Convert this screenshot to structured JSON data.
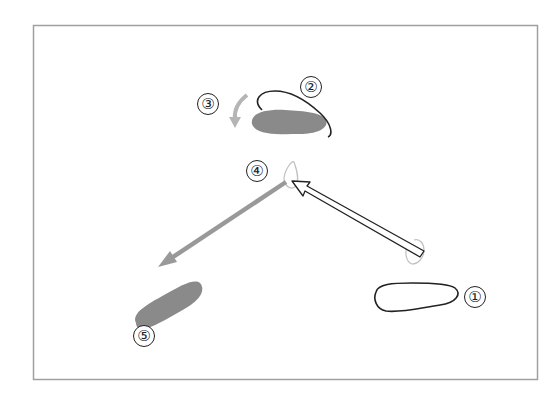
{
  "diagram": {
    "type": "motion-sequence",
    "frame": {
      "x": 33,
      "y": 25,
      "width": 505,
      "height": 355,
      "stroke": "#a0a0a0"
    },
    "colors": {
      "outline": "#222222",
      "fill_shape": "#8a8a8a",
      "gray_arrow": "#999999",
      "light_arrow": "#b5b5b5",
      "white_arrow_fill": "#ffffff"
    },
    "steps": [
      {
        "id": "1",
        "label": "①",
        "description": "outlined blob (start position)",
        "x": 475,
        "y": 297
      },
      {
        "id": "2",
        "label": "②",
        "description": "outlined blob tilted above gray blob",
        "x": 311,
        "y": 87
      },
      {
        "id": "3",
        "label": "③",
        "description": "curved light-gray arrow pointing down-left",
        "x": 208,
        "y": 104
      },
      {
        "id": "4",
        "label": "④",
        "description": "pivot point where white arrow meets gray arrow",
        "x": 257,
        "y": 171
      },
      {
        "id": "5",
        "label": "⑤",
        "description": "gray filled blob (end position)",
        "x": 144,
        "y": 336
      }
    ],
    "arrows": [
      {
        "id": "white-arrow",
        "from": [
          421,
          251
        ],
        "to": [
          292,
          181
        ],
        "style": "outlined white"
      },
      {
        "id": "gray-arrow",
        "from": [
          285,
          181
        ],
        "to": [
          160,
          265
        ],
        "style": "solid gray"
      }
    ]
  }
}
